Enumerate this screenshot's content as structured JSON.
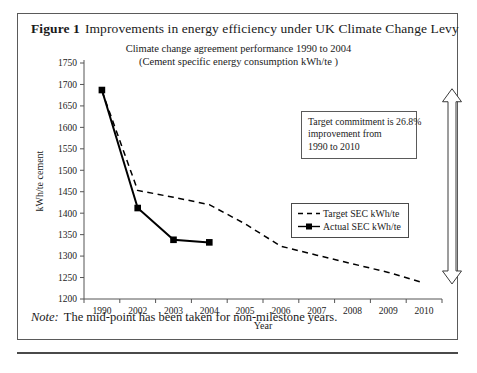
{
  "figure": {
    "label": "Figure 1",
    "title": "Improvements in energy efficiency under UK Climate Change Levy",
    "note_label": "Note:",
    "note_text": "The mid-point has been taken for non-milestone years."
  },
  "annotation": {
    "line1": "Target commitment is 26.8%",
    "line2": "improvement from",
    "line3": "1990 to 2010"
  },
  "arrow": {
    "name": "double-headed-vertical-arrow",
    "top_value": 1690,
    "bottom_value": 1235
  },
  "colors": {
    "line": "#000000",
    "frame": "#5a5a5a",
    "axis": "#555555",
    "text": "#1a1a1a"
  },
  "chart_data": {
    "type": "line",
    "title": "Climate change agreement performance 1990 to 2004",
    "subtitle": "(Cement specific energy consumption kWh/te )",
    "xlabel": "Year",
    "ylabel": "kWh/te cement",
    "categories": [
      "1990",
      "2002",
      "2003",
      "2004",
      "2005",
      "2006",
      "2007",
      "2008",
      "2009",
      "2010"
    ],
    "yticks": [
      1200,
      1250,
      1300,
      1350,
      1400,
      1450,
      1500,
      1550,
      1600,
      1650,
      1700,
      1750
    ],
    "ylim": [
      1200,
      1750
    ],
    "grid": false,
    "legend_position": "center-right",
    "series": [
      {
        "name": "Target SEC kWh/te",
        "style": "dashed",
        "marker": "none",
        "values": [
          1685,
          1453,
          1437,
          1420,
          1375,
          1323,
          1302,
          1282,
          1262,
          1237
        ]
      },
      {
        "name": "Actual SEC kWh/te",
        "style": "solid",
        "marker": "square",
        "values": [
          1687,
          1412,
          1338,
          1332,
          null,
          null,
          null,
          null,
          null,
          null
        ]
      }
    ]
  }
}
